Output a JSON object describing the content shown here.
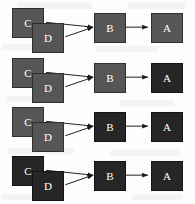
{
  "figure": {
    "title": "",
    "width": 195,
    "height": 204,
    "background_color": "#fdfdfd",
    "node_colors": {
      "gray": "#565656",
      "dark": "#262626",
      "label": "#ffffff",
      "edge": "#1a1a1a"
    },
    "node_size": {
      "width": 32,
      "height": 30
    },
    "labels": {
      "a": "A",
      "b": "B",
      "c": "C",
      "d": "D"
    },
    "rows": [
      {
        "index": 1,
        "top": 6,
        "nodes": [
          {
            "id": "c",
            "label": "C",
            "shade": "gray"
          },
          {
            "id": "d",
            "label": "D",
            "shade": "gray"
          },
          {
            "id": "b",
            "label": "B",
            "shade": "gray"
          },
          {
            "id": "a",
            "label": "A",
            "shade": "gray"
          }
        ]
      },
      {
        "index": 2,
        "top": 56,
        "nodes": [
          {
            "id": "c",
            "label": "C",
            "shade": "gray"
          },
          {
            "id": "d",
            "label": "D",
            "shade": "gray"
          },
          {
            "id": "b",
            "label": "B",
            "shade": "gray"
          },
          {
            "id": "a",
            "label": "A",
            "shade": "dark"
          }
        ]
      },
      {
        "index": 3,
        "top": 105,
        "nodes": [
          {
            "id": "c",
            "label": "C",
            "shade": "gray"
          },
          {
            "id": "d",
            "label": "D",
            "shade": "gray"
          },
          {
            "id": "b",
            "label": "B",
            "shade": "dark"
          },
          {
            "id": "a",
            "label": "A",
            "shade": "dark"
          }
        ]
      },
      {
        "index": 4,
        "top": 154,
        "nodes": [
          {
            "id": "c",
            "label": "C",
            "shade": "dark"
          },
          {
            "id": "d",
            "label": "D",
            "shade": "dark"
          },
          {
            "id": "b",
            "label": "B",
            "shade": "dark"
          },
          {
            "id": "a",
            "label": "A",
            "shade": "dark"
          }
        ]
      }
    ],
    "edges": [
      {
        "from": "c",
        "to": "b"
      },
      {
        "from": "d",
        "to": "b"
      },
      {
        "from": "b",
        "to": "a"
      }
    ]
  }
}
